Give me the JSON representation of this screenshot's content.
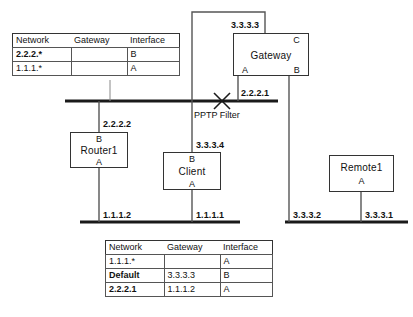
{
  "diagram": {
    "line_color": "#1a1a1a",
    "box_border_color": "#333333"
  },
  "nodes": [
    {
      "id": "gateway",
      "name": "Gateway",
      "iface_top": "C",
      "iface_bottom_left": "A",
      "iface_bottom_right": "B"
    },
    {
      "id": "router1",
      "name": "Router1",
      "iface_top": "B",
      "iface_bottom_left": "A"
    },
    {
      "id": "client",
      "name": "Client",
      "iface_top": "B",
      "iface_bottom_left": "A"
    },
    {
      "id": "remote1",
      "name": "Remote1",
      "iface_bottom": "A"
    }
  ],
  "addresses": {
    "gateway_c": "3.3.3.3",
    "gateway_a": "2.2.2.1",
    "gateway_b": "3.3.3.2",
    "router1_b": "2.2.2.2",
    "router1_a": "1.1.1.2",
    "client_b": "3.3.3.4",
    "client_a": "1.1.1.1",
    "remote1_a": "3.3.3.1"
  },
  "filter": {
    "label": "PPTP Filter",
    "icon": "x-cross-icon"
  },
  "tables": [
    {
      "id": "table-top",
      "headers": [
        "Network",
        "Gateway",
        "Interface"
      ],
      "rows": [
        {
          "network": "2.2.2.*",
          "gateway": "",
          "interface": "B",
          "bold": false
        },
        {
          "network": "1.1.1.*",
          "gateway": "",
          "interface": "A",
          "bold": false
        }
      ]
    },
    {
      "id": "table-bottom",
      "headers": [
        "Network",
        "Gateway",
        "Interface"
      ],
      "rows": [
        {
          "network": "1.1.1.*",
          "gateway": "",
          "interface": "A",
          "bold": false
        },
        {
          "network": "Default",
          "gateway": "3.3.3.3",
          "interface": "B",
          "bold": true
        },
        {
          "network": "2.2.2.1",
          "gateway": "1.1.1.2",
          "interface": "A",
          "bold": true
        }
      ]
    }
  ]
}
